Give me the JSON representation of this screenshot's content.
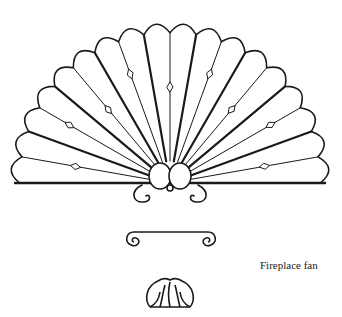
{
  "figure": {
    "caption": "Fireplace fan",
    "parts": [
      "fan",
      "scroll-bar",
      "shell-ornament"
    ],
    "fan": {
      "blade_count": 18,
      "center": [
        170,
        183
      ],
      "radius": 155,
      "ink_color": "#1a1a1a",
      "background": "#ffffff"
    }
  }
}
